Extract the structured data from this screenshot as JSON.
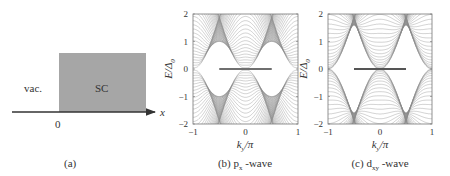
{
  "panel_a": {
    "vacuum_label": "vac.",
    "sc_label": "SC",
    "origin_label": "0",
    "axis_label": "x",
    "caption": "(a)",
    "sc_color": "#a6a6a6"
  },
  "panel_b": {
    "caption_prefix": "(b) p",
    "caption_sub": "x",
    "caption_suffix": " -wave",
    "ylabel": "E/Δ",
    "ylabel_sub": "0",
    "xlabel": "k",
    "xlabel_sub": "y",
    "xlabel_suffix": "/π"
  },
  "panel_c": {
    "caption_prefix": "(c) d",
    "caption_sub": "xy",
    "caption_suffix": " -wave",
    "ylabel": "E/Δ",
    "ylabel_sub": "0",
    "xlabel": "k",
    "xlabel_sub": "y",
    "xlabel_suffix": "/π"
  },
  "colors": {
    "band": "#8a8a8a",
    "zero_mode": "#6f6f6f",
    "axis": "#555555"
  },
  "chart_data": [
    {
      "type": "line",
      "title": "(b) px-wave",
      "xlabel": "k_y/π",
      "ylabel": "E/Δ0",
      "xlim": [
        -1,
        1
      ],
      "ylim": [
        -2,
        2
      ],
      "xticks": [
        -1,
        0,
        1
      ],
      "yticks": [
        -2,
        -1,
        0,
        1,
        2
      ],
      "grid": false,
      "description": "Quasiparticle band spectrum vs k_y; bulk bands fill regions outside gap; flat zero-energy edge state spans k_y/π ≈ -0.5 to 0.5",
      "zero_mode_range": [
        -0.5,
        0.5
      ],
      "gap_edge_at_ky0": 1.0,
      "band_crossing_points": [
        -0.5,
        0.5
      ]
    },
    {
      "type": "line",
      "title": "(c) dxy-wave",
      "xlabel": "k_y/π",
      "ylabel": "E/Δ0",
      "xlim": [
        -1,
        1
      ],
      "ylim": [
        -2,
        2
      ],
      "xticks": [
        -1,
        0,
        1
      ],
      "yticks": [
        -2,
        -1,
        0,
        1,
        2
      ],
      "grid": false,
      "description": "Quasiparticle band spectrum vs k_y; gap closes at k_y=0 (nodal); flat zero-energy edge state spans k_y/π ≈ -0.5 to 0.5",
      "zero_mode_range": [
        -0.5,
        0.5
      ],
      "gap_edge_max": 0.75,
      "band_crossing_points": [
        -0.5,
        0,
        0.5
      ]
    }
  ],
  "ticks": {
    "y": [
      "2",
      "1",
      "0",
      "−1",
      "−2"
    ],
    "x": [
      "−1",
      "0",
      "1"
    ]
  }
}
